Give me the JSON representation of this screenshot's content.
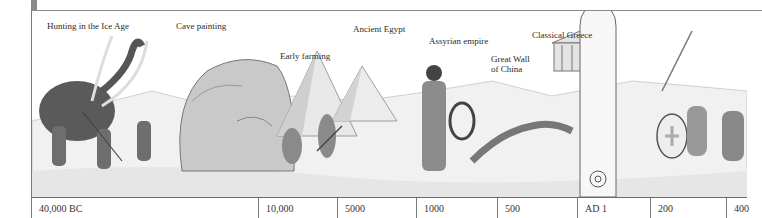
{
  "illustration": {
    "captions": [
      {
        "id": "ice-age",
        "text": "Hunting in the Ice Age"
      },
      {
        "id": "cave-painting",
        "text": "Cave painting"
      },
      {
        "id": "early-farming",
        "text": "Early farming"
      },
      {
        "id": "ancient-egypt",
        "text": "Ancient Egypt"
      },
      {
        "id": "assyrian-empire",
        "text": "Assyrian empire"
      },
      {
        "id": "great-wall",
        "line1": "Great Wall",
        "line2": "of China"
      },
      {
        "id": "classical-greece",
        "text": "Classical Greece"
      }
    ]
  },
  "timeline": {
    "ticks": [
      "40,000 BC",
      "10,000",
      "5000",
      "1000",
      "500",
      "AD 1",
      "200",
      "400"
    ]
  }
}
